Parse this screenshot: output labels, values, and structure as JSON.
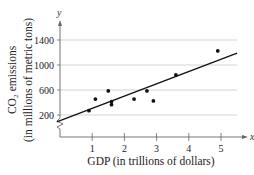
{
  "chart_data": {
    "type": "scatter",
    "title": "",
    "xlabel": "GDP (in trillions of dollars)",
    "ylabel_line1": "CO₂ emissions",
    "ylabel_line2": "(in millions of metric tons)",
    "x_axis_var": "x",
    "y_axis_var": "y",
    "xlim": [
      0,
      5.5
    ],
    "ylim": [
      0,
      1600
    ],
    "y_axis_break": true,
    "grid": "horizontal",
    "x_ticks": [
      1,
      2,
      3,
      4,
      5
    ],
    "x_tick_labels": [
      "1",
      "2",
      "3",
      "4",
      "5"
    ],
    "y_ticks": [
      200,
      600,
      1000,
      1400
    ],
    "y_tick_labels": [
      "200",
      "600",
      "1000",
      "1400"
    ],
    "legend": null,
    "series": [
      {
        "name": "data points",
        "type": "scatter",
        "points": [
          {
            "x": 0.9,
            "y": 270
          },
          {
            "x": 1.1,
            "y": 455
          },
          {
            "x": 1.5,
            "y": 585
          },
          {
            "x": 1.6,
            "y": 415
          },
          {
            "x": 1.6,
            "y": 365
          },
          {
            "x": 2.3,
            "y": 455
          },
          {
            "x": 2.7,
            "y": 585
          },
          {
            "x": 2.9,
            "y": 425
          },
          {
            "x": 3.6,
            "y": 840
          },
          {
            "x": 4.9,
            "y": 1225
          }
        ]
      },
      {
        "name": "linear regression line",
        "type": "line",
        "points": [
          {
            "x": -0.1,
            "y": 90
          },
          {
            "x": 5.5,
            "y": 1190
          }
        ]
      }
    ],
    "colors": {
      "points": "#111111",
      "line": "#111111",
      "axes": "#666666",
      "grid": "#c8c8c8"
    }
  }
}
